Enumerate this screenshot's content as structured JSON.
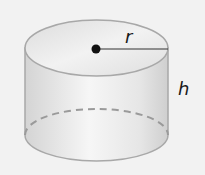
{
  "diagram": {
    "shape": "cylinder",
    "labels": {
      "radius": "r",
      "height": "h"
    },
    "colors": {
      "background": "#f2f2f2",
      "outline": "#a8a8a8",
      "fill_light": "#f4f4f4",
      "fill_shade": "#d6d6d6",
      "hidden_edge": "#9a9a9a",
      "center_dot": "#111111",
      "radius_line": "#333333"
    }
  }
}
